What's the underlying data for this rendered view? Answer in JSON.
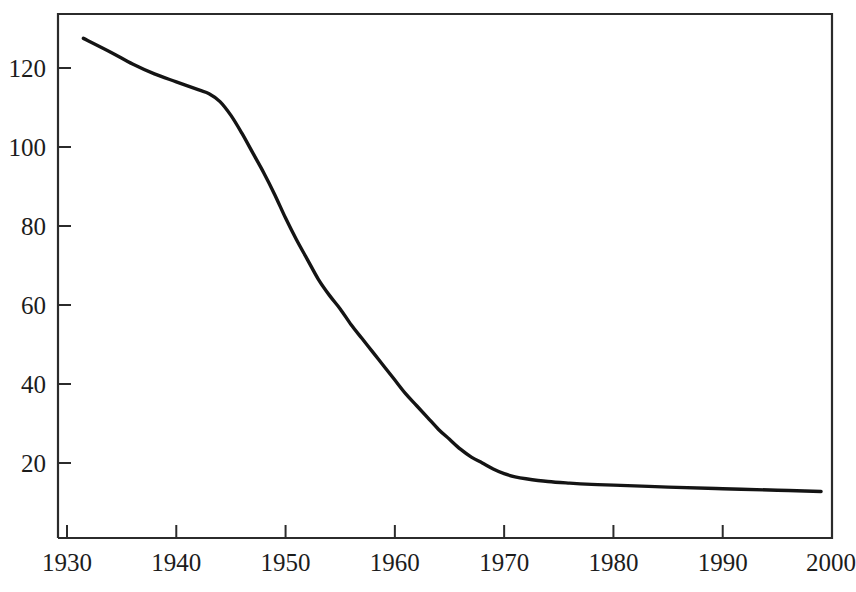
{
  "chart_data": {
    "type": "line",
    "title": "",
    "subtitle": "",
    "xlabel": "",
    "ylabel": "",
    "xlim": [
      1930,
      2000
    ],
    "ylim": [
      0,
      133
    ],
    "grid": false,
    "legend": null,
    "legend_position": "none",
    "x_ticks": [
      1930,
      1940,
      1950,
      1960,
      1970,
      1980,
      1990,
      2000
    ],
    "x_tick_labels": [
      "1930",
      "1940",
      "1950",
      "1960",
      "1970",
      "1980",
      "1990",
      "2000"
    ],
    "y_ticks": [
      20,
      40,
      60,
      80,
      100,
      120
    ],
    "y_tick_labels": [
      "20",
      "40",
      "60",
      "80",
      "100",
      "120"
    ],
    "line_color": "#141414",
    "frame_color": "#2b2b2b",
    "background_color": "#ffffff",
    "series": [
      {
        "name": "series-1",
        "x": [
          1931.5,
          1934,
          1936,
          1938,
          1940,
          1942,
          1943,
          1944,
          1945,
          1946,
          1947,
          1948,
          1949,
          1950,
          1951,
          1952,
          1953,
          1954,
          1955,
          1956,
          1957,
          1958,
          1959,
          1960,
          1961,
          1962,
          1963,
          1964,
          1965,
          1966,
          1967,
          1968,
          1969,
          1970,
          1971,
          1972,
          1974,
          1976,
          1978,
          1980,
          1985,
          1990,
          1995,
          1999
        ],
        "values": [
          127.5,
          124.0,
          121.0,
          118.5,
          116.5,
          114.5,
          113.5,
          111.5,
          108.0,
          103.5,
          98.5,
          93.5,
          88.0,
          82.0,
          76.5,
          71.5,
          66.5,
          62.5,
          59.0,
          55.0,
          51.5,
          48.0,
          44.5,
          41.0,
          37.5,
          34.5,
          31.5,
          28.5,
          26.0,
          23.5,
          21.5,
          20.0,
          18.5,
          17.3,
          16.5,
          16.0,
          15.3,
          14.9,
          14.6,
          14.4,
          13.9,
          13.5,
          13.1,
          12.8
        ]
      }
    ]
  },
  "axes": {
    "x_axis_name": "year-axis",
    "y_axis_name": "value-axis"
  }
}
